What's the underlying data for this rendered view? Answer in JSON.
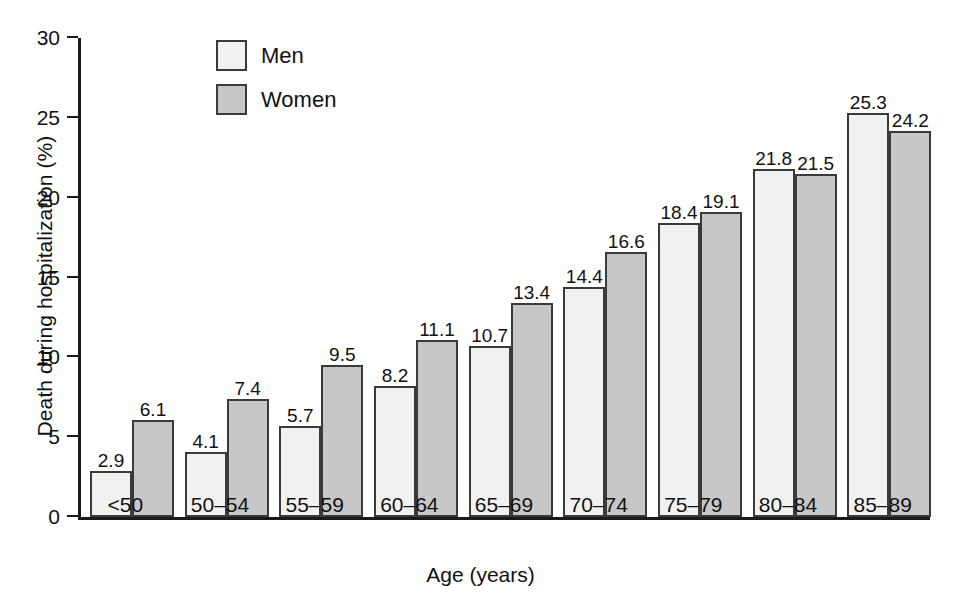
{
  "chart_data": {
    "type": "bar",
    "title": "",
    "xlabel": "Age (years)",
    "ylabel": "Death during hospitalization (%)",
    "categories": [
      "<50",
      "50–54",
      "55–59",
      "60–64",
      "65–69",
      "70–74",
      "75–79",
      "80–84",
      "85–89"
    ],
    "series": [
      {
        "name": "Men",
        "color": "#f1f1f1",
        "values": [
          2.9,
          4.1,
          5.7,
          8.2,
          10.7,
          14.4,
          18.4,
          21.8,
          25.3
        ]
      },
      {
        "name": "Women",
        "color": "#c7c7c7",
        "values": [
          6.1,
          7.4,
          9.5,
          11.1,
          13.4,
          16.6,
          19.1,
          21.5,
          24.2
        ]
      }
    ],
    "value_labels": [
      [
        "2.9",
        "6.1"
      ],
      [
        "4.1",
        "7.4"
      ],
      [
        "5.7",
        "9.5"
      ],
      [
        "8.2",
        "11.1"
      ],
      [
        "10.7",
        "13.4"
      ],
      [
        "14.4",
        "16.6"
      ],
      [
        "18.4",
        "19.1"
      ],
      [
        "21.8",
        "21.5"
      ],
      [
        "25.3",
        "24.2"
      ]
    ],
    "ylim": [
      0,
      30
    ],
    "yticks": [
      0,
      5,
      10,
      15,
      20,
      25,
      30
    ],
    "ytick_labels": [
      "0",
      "5",
      "10",
      "15",
      "20",
      "25",
      "30"
    ],
    "grid": false,
    "legend_position": "top-left-inside",
    "legend": [
      "Men",
      "Women"
    ]
  }
}
